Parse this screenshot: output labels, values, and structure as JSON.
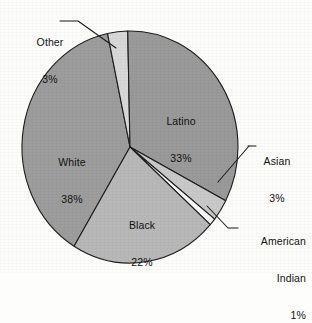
{
  "chart_data": {
    "type": "pie",
    "title": "",
    "subtitle": "",
    "xlabel": "",
    "ylabel": "",
    "legend_position": "none",
    "grid": false,
    "categories": [
      "Other",
      "Latino",
      "Asian",
      "American Indian",
      "Black",
      "White"
    ],
    "values": [
      3,
      33,
      3,
      1,
      22,
      38
    ],
    "value_unit": "%",
    "slices": [
      {
        "name": "Other",
        "label": "Other",
        "value": 3,
        "value_label": "3%",
        "color": "#d8d8d8",
        "label_placement": "outside",
        "label_lines": [
          "Other",
          "3%"
        ]
      },
      {
        "name": "Latino",
        "label": "Latino",
        "value": 33,
        "value_label": "33%",
        "color": "#9a9a9a",
        "label_placement": "inside",
        "label_lines": [
          "Latino",
          "33%"
        ]
      },
      {
        "name": "Asian",
        "label": "Asian",
        "value": 3,
        "value_label": "3%",
        "color": "#c9c9c9",
        "label_placement": "outside",
        "label_lines": [
          "Asian",
          "3%"
        ]
      },
      {
        "name": "American Indian",
        "label": "American Indian",
        "value": 1,
        "value_label": "1%",
        "color": "#f7f7f5",
        "label_placement": "outside",
        "label_lines": [
          "American",
          "Indian",
          "1%"
        ]
      },
      {
        "name": "Black",
        "label": "Black",
        "value": 22,
        "value_label": "22%",
        "color": "#b8b8b8",
        "label_placement": "inside",
        "label_lines": [
          "Black",
          "22%"
        ]
      },
      {
        "name": "White",
        "label": "White",
        "value": 38,
        "value_label": "38%",
        "color": "#9d9d9d",
        "label_placement": "inside",
        "label_lines": [
          "White",
          "38%"
        ]
      }
    ]
  },
  "labels": {
    "other": {
      "line1": "Other",
      "line2": "3%"
    },
    "latino": {
      "line1": "Latino",
      "line2": "33%"
    },
    "asian": {
      "line1": "Asian",
      "line2": "3%"
    },
    "amerind": {
      "line1": "American",
      "line2": "Indian",
      "line3": "1%"
    },
    "black": {
      "line1": "Black",
      "line2": "22%"
    },
    "white": {
      "line1": "White",
      "line2": "38%"
    }
  },
  "colors": {
    "outline": "#1d1d1d",
    "background": "#fdfdfb",
    "text": "#121212"
  }
}
